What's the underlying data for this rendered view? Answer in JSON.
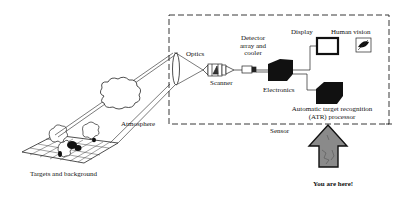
{
  "diagram": {
    "labels": {
      "optics": "Optics",
      "scanner": "Scanner",
      "detector_line1": "Detector",
      "detector_line2": "array and",
      "detector_line3": "cooler",
      "electronics": "Electronics",
      "display": "Display",
      "human_vision": "Human vision",
      "atr_line1": "Automatic target recognition",
      "atr_line2": "(ATR) processor",
      "sensor": "Sensor",
      "atmosphere": "Atmosphere",
      "targets": "Targets and background",
      "you_are_here": "You are here!"
    },
    "colors": {
      "ink": "#111111",
      "arrow_fill": "#8a8a8a",
      "background": "#ffffff"
    }
  }
}
